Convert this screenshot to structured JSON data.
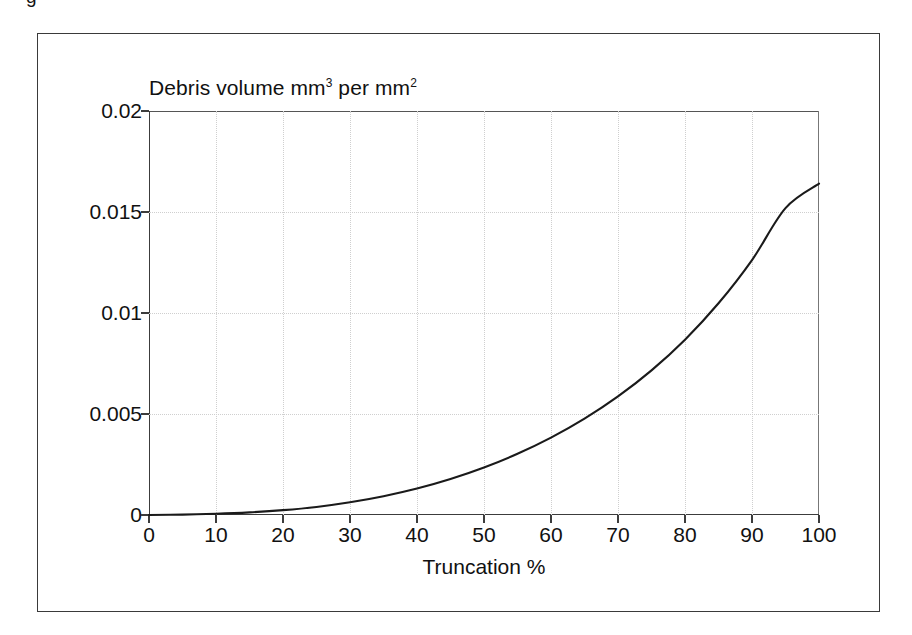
{
  "figure": {
    "caption_fragment": "g",
    "frame_color": "#3a3a3a",
    "background": "#ffffff"
  },
  "chart_data": {
    "type": "line",
    "title": "Debris volume mm3 per mm2",
    "title_parts": {
      "before_sup1": "Debris volume mm",
      "sup1": "3",
      "between": " per mm",
      "sup2": "2"
    },
    "xlabel": "Truncation %",
    "ylabel": "",
    "xlim": [
      0,
      100
    ],
    "ylim": [
      0,
      0.02
    ],
    "grid": true,
    "grid_style": "dotted",
    "grid_color": "#cfcfcf",
    "legend": "none",
    "line_color": "#1a1a1a",
    "xticks": [
      0,
      10,
      20,
      30,
      40,
      50,
      60,
      70,
      80,
      90,
      100
    ],
    "xtick_labels": [
      "0",
      "10",
      "20",
      "30",
      "40",
      "50",
      "60",
      "70",
      "80",
      "90",
      "100"
    ],
    "yticks": [
      0,
      0.005,
      0.01,
      0.015,
      0.02
    ],
    "ytick_labels": [
      "0",
      "0.005",
      "0.01",
      "0.015",
      "0.02"
    ],
    "series": [
      {
        "name": "Debris volume",
        "x": [
          0,
          5,
          10,
          15,
          20,
          25,
          30,
          35,
          40,
          45,
          50,
          55,
          60,
          65,
          70,
          75,
          80,
          85,
          90,
          95,
          100
        ],
        "values": [
          0.0,
          2e-05,
          6e-05,
          0.00013,
          0.00024,
          0.0004,
          0.00063,
          0.00093,
          0.00131,
          0.00178,
          0.00235,
          0.00303,
          0.00383,
          0.00477,
          0.00587,
          0.00716,
          0.00868,
          0.01048,
          0.01262,
          0.01519,
          0.0164
        ]
      }
    ]
  }
}
